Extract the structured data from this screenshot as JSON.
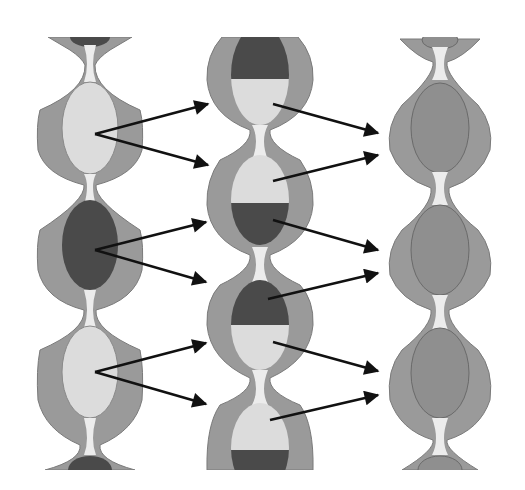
{
  "diagram": {
    "colors": {
      "background": "#ffffff",
      "wall": "#9a9a9a",
      "wall_stroke": "#7a7a7a",
      "light": "#dcdcdc",
      "dark": "#4a4a4a",
      "medium": "#8f8f8f",
      "gap": "#ececec",
      "arrow": "#111111"
    },
    "columns": [
      {
        "id": "left",
        "segments": [
          "dark-partial",
          "light",
          "dark",
          "light",
          "dark-partial"
        ]
      },
      {
        "id": "middle",
        "segments": [
          "dark/light",
          "light/dark",
          "dark/light",
          "light/dark"
        ]
      },
      {
        "id": "right",
        "segments": [
          "medium-partial",
          "medium",
          "medium",
          "medium",
          "medium-partial"
        ]
      }
    ],
    "arrows_left_to_middle": 6,
    "arrows_middle_to_right": 8
  }
}
